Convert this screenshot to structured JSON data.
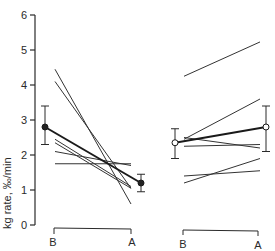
{
  "chart_data": {
    "type": "line",
    "title": "",
    "ylabel": "kg rate, ‰/min",
    "xlabel": "",
    "ylim": [
      0,
      6
    ],
    "yticks": [
      0,
      1,
      2,
      3,
      4,
      5,
      6
    ],
    "grid": false,
    "legend": null,
    "panels": [
      {
        "name": "left",
        "categories": [
          "B",
          "A"
        ],
        "individual_series": [
          {
            "values": [
              4.45,
              0.6
            ]
          },
          {
            "values": [
              4.1,
              1.05
            ]
          },
          {
            "values": [
              2.45,
              1.1
            ]
          },
          {
            "values": [
              2.35,
              1.05
            ]
          },
          {
            "values": [
              2.1,
              1.7
            ]
          },
          {
            "values": [
              1.75,
              1.75
            ]
          }
        ],
        "mean": {
          "values": [
            2.8,
            1.2
          ],
          "error_low": [
            2.3,
            0.95
          ],
          "error_high": [
            3.4,
            1.45
          ],
          "marker": "filled-circle"
        }
      },
      {
        "name": "right",
        "categories": [
          "B",
          "A"
        ],
        "individual_series": [
          {
            "values": [
              4.25,
              5.23
            ]
          },
          {
            "values": [
              2.45,
              3.6
            ]
          },
          {
            "values": [
              2.5,
              2.2
            ]
          },
          {
            "values": [
              2.25,
              2.3
            ]
          },
          {
            "values": [
              1.4,
              1.55
            ]
          },
          {
            "values": [
              1.2,
              1.9
            ]
          }
        ],
        "mean": {
          "values": [
            2.35,
            2.8
          ],
          "error_low": [
            1.9,
            2.1
          ],
          "error_high": [
            2.75,
            3.4
          ],
          "marker": "open-circle"
        }
      }
    ]
  },
  "labels": {
    "ylabel": "kg rate, ‰/min",
    "ytick": [
      "0",
      "1",
      "2",
      "3",
      "4",
      "5",
      "6"
    ],
    "left_b": "B",
    "left_a": "A",
    "right_b": "B",
    "right_a": "A"
  }
}
